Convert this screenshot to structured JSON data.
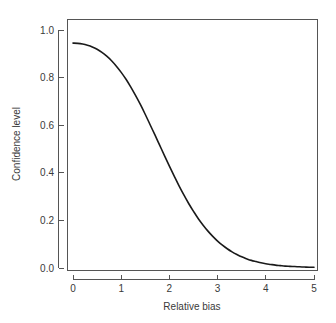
{
  "chart_data": {
    "type": "line",
    "title": "",
    "subtitle": "",
    "xlabel": "Relative bias",
    "ylabel": "Confidence level",
    "xlim": [
      0,
      5
    ],
    "ylim": [
      0.0,
      1.0
    ],
    "grid": false,
    "legend": null,
    "legend_position": "none",
    "x_ticks": [
      0,
      1,
      2,
      3,
      4,
      5
    ],
    "x_tick_labels": [
      "0",
      "1",
      "2",
      "3",
      "4",
      "5"
    ],
    "y_ticks": [
      0.0,
      0.2,
      0.4,
      0.6,
      0.8,
      1.0
    ],
    "y_tick_labels": [
      "0.0",
      "0.2",
      "0.4",
      "0.6",
      "0.8",
      "1.0"
    ],
    "series": [
      {
        "name": "Confidence level",
        "color": "#1a1a1a",
        "x": [
          0.0,
          0.1,
          0.2,
          0.3,
          0.4,
          0.5,
          0.6,
          0.7,
          0.8,
          0.9,
          1.0,
          1.1,
          1.2,
          1.3,
          1.4,
          1.5,
          1.6,
          1.7,
          1.8,
          1.9,
          2.0,
          2.1,
          2.2,
          2.3,
          2.4,
          2.5,
          2.6,
          2.7,
          2.8,
          2.9,
          3.0,
          3.1,
          3.2,
          3.3,
          3.4,
          3.5,
          3.6,
          3.7,
          3.8,
          3.9,
          4.0,
          4.1,
          4.2,
          4.3,
          4.4,
          4.5,
          4.6,
          4.7,
          4.8,
          4.9,
          5.0
        ],
        "values": [
          0.945,
          0.944,
          0.941,
          0.936,
          0.929,
          0.919,
          0.906,
          0.89,
          0.871,
          0.848,
          0.822,
          0.793,
          0.76,
          0.724,
          0.686,
          0.645,
          0.602,
          0.559,
          0.515,
          0.471,
          0.428,
          0.386,
          0.345,
          0.307,
          0.271,
          0.238,
          0.207,
          0.18,
          0.155,
          0.133,
          0.113,
          0.096,
          0.081,
          0.068,
          0.057,
          0.047,
          0.039,
          0.032,
          0.027,
          0.022,
          0.018,
          0.015,
          0.012,
          0.01,
          0.008,
          0.007,
          0.006,
          0.005,
          0.004,
          0.003,
          0.003
        ]
      }
    ]
  },
  "axes": {
    "x_title": "Relative bias",
    "y_title": "Confidence level"
  },
  "colors": {
    "background": "#ffffff",
    "curve": "#1a1a1a",
    "axis": "#555555",
    "text": "#3a3a3a"
  }
}
